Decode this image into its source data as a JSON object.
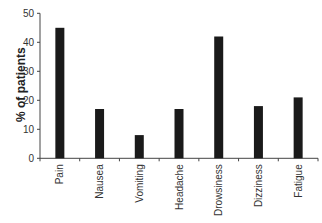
{
  "chart_data": {
    "type": "bar",
    "title": "",
    "xlabel": "",
    "ylabel": "% of patients",
    "ylim": [
      0,
      50
    ],
    "yticks": [
      0,
      10,
      20,
      30,
      40,
      50
    ],
    "grid": false,
    "legend": null,
    "categories": [
      "Pain",
      "Nausea",
      "Vomiting",
      "Headache",
      "Drowsiness",
      "Dizziness",
      "Fatigue"
    ],
    "values": [
      45,
      17,
      8,
      17,
      42,
      18,
      21
    ],
    "bar_color": "#1a1a1a"
  }
}
